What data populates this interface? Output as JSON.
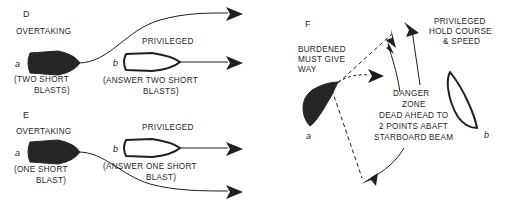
{
  "figure": {
    "background_color": "#ffffff",
    "ink_color": "#1f1f1f",
    "hull_dark_color": "#262626",
    "hull_light_color": "#ffffff"
  },
  "panels": [
    {
      "id": "D",
      "label": "D",
      "situation": "OVERTAKING",
      "vessel_a": {
        "tag": "a",
        "role": "OVERTAKING",
        "signal": "(TWO SHORT",
        "signal_line2": "BLASTS)",
        "fill": "dark"
      },
      "vessel_b": {
        "tag": "b",
        "role": "PRIVILEGED",
        "signal": "(ANSWER TWO SHORT",
        "signal_line2": "BLASTS)",
        "fill": "light"
      }
    },
    {
      "id": "E",
      "label": "E",
      "situation": "OVERTAKING",
      "vessel_a": {
        "tag": "a",
        "role": "OVERTAKING",
        "signal": "(ONE SHORT",
        "signal_line2": "BLAST)",
        "fill": "dark"
      },
      "vessel_b": {
        "tag": "b",
        "role": "PRIVILEGED",
        "signal": "(ANSWER ONE SHORT",
        "signal_line2": "BLAST)",
        "fill": "light"
      }
    },
    {
      "id": "F",
      "label": "F",
      "vessel_a": {
        "tag": "a",
        "role_line1": "BURDENED",
        "role_line2": "MUST GIVE",
        "role_line3": "WAY",
        "fill": "dark"
      },
      "vessel_b": {
        "tag": "b",
        "role_line1": "PRIVILEGED",
        "role_line2": "HOLD COURSE",
        "role_line3": "& SPEED",
        "fill": "light"
      },
      "danger_zone": {
        "line1": "DANGER",
        "line2": "ZONE",
        "line3": "DEAD AHEAD TO",
        "line4": "2 POINTS ABAFT",
        "line5": "STARBOARD BEAM"
      }
    }
  ]
}
